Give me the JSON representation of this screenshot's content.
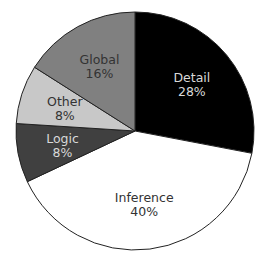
{
  "chart_data": {
    "type": "pie",
    "title": "",
    "start_angle_deg": 0,
    "direction": "clockwise",
    "slices": [
      {
        "label": "Detail",
        "value": 28,
        "pct_label": "28%",
        "color": "#000000",
        "text_color": "#d9d9d9"
      },
      {
        "label": "Inference",
        "value": 40,
        "pct_label": "40%",
        "color": "#ffffff",
        "text_color": "#333333"
      },
      {
        "label": "Logic",
        "value": 8,
        "pct_label": "8%",
        "color": "#404040",
        "text_color": "#d9d9d9"
      },
      {
        "label": "Other",
        "value": 8,
        "pct_label": "8%",
        "color": "#c8c8c8",
        "text_color": "#333333"
      },
      {
        "label": "Global",
        "value": 16,
        "pct_label": "16%",
        "color": "#808080",
        "text_color": "#333333"
      }
    ],
    "categories": [
      "Detail",
      "Inference",
      "Logic",
      "Other",
      "Global"
    ],
    "values": [
      28,
      40,
      8,
      8,
      16
    ],
    "legend": "none",
    "border_color": "#222222"
  }
}
